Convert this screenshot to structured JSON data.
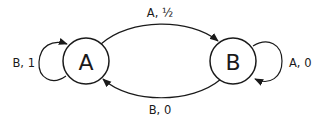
{
  "diagram": {
    "type": "state-machine",
    "states": [
      {
        "id": "A",
        "label": "A"
      },
      {
        "id": "B",
        "label": "B"
      }
    ],
    "transitions": [
      {
        "from": "A",
        "to": "B",
        "label": "A, ½"
      },
      {
        "from": "B",
        "to": "A",
        "label": "B, 0"
      },
      {
        "from": "A",
        "to": "A",
        "label": "B, 1"
      },
      {
        "from": "B",
        "to": "B",
        "label": "A, 0"
      }
    ],
    "colors": {
      "stroke": "#1a1a1a",
      "background": "#ffffff"
    }
  }
}
